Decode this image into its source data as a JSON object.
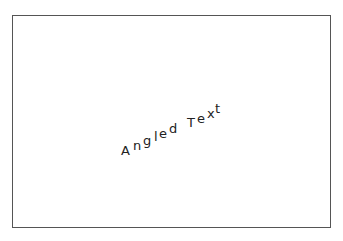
{
  "label": {
    "text": "Angled Text",
    "chars": [
      {
        "c": "A",
        "x": 121,
        "y": 144
      },
      {
        "c": "n",
        "x": 133,
        "y": 139
      },
      {
        "c": "g",
        "x": 143,
        "y": 134
      },
      {
        "c": "l",
        "x": 154,
        "y": 130
      },
      {
        "c": "e",
        "x": 159,
        "y": 127
      },
      {
        "c": "d",
        "x": 169,
        "y": 122
      },
      {
        "c": "T",
        "x": 187,
        "y": 116
      },
      {
        "c": "e",
        "x": 197,
        "y": 112
      },
      {
        "c": "x",
        "x": 207,
        "y": 107
      },
      {
        "c": "t",
        "x": 215,
        "y": 102
      }
    ],
    "color": "#222222"
  },
  "frame": {
    "border_color": "#555555"
  }
}
